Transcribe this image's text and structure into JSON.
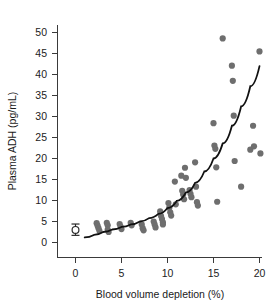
{
  "chart_data": {
    "type": "scatter",
    "title": "",
    "xlabel": "Blood volume depletion (%)",
    "ylabel": "Plasma ADH (pg/mL)",
    "xlim": [
      -1.5,
      21
    ],
    "ylim": [
      -1.5,
      52
    ],
    "xticks": [
      0,
      5,
      10,
      15,
      20
    ],
    "xticklabels": [
      "0",
      "5",
      "10",
      "15",
      "20"
    ],
    "yticks": [
      0,
      5,
      10,
      15,
      20,
      25,
      30,
      35,
      40,
      45,
      50
    ],
    "yticklabels": [
      "0",
      "5",
      "10",
      "15",
      "20",
      "25",
      "30",
      "35",
      "40",
      "45",
      "50"
    ],
    "grid": false,
    "legend": "none",
    "point_color": "#6e6e6e",
    "curve_color": "#111111",
    "series": [
      {
        "name": "Subjects",
        "marker": "filled-circle",
        "points": [
          [
            2.3,
            4.6
          ],
          [
            2.4,
            4.0
          ],
          [
            2.5,
            3.4
          ],
          [
            2.6,
            2.8
          ],
          [
            3.4,
            4.7
          ],
          [
            3.5,
            4.1
          ],
          [
            3.5,
            3.1
          ],
          [
            3.6,
            2.5
          ],
          [
            4.8,
            4.4
          ],
          [
            4.9,
            3.8
          ],
          [
            5.0,
            3.2
          ],
          [
            6.0,
            4.7
          ],
          [
            6.1,
            4.1
          ],
          [
            7.2,
            4.3
          ],
          [
            7.3,
            3.4
          ],
          [
            7.4,
            2.9
          ],
          [
            8.5,
            5.0
          ],
          [
            8.6,
            4.3
          ],
          [
            8.7,
            3.6
          ],
          [
            9.2,
            7.4
          ],
          [
            9.3,
            6.3
          ],
          [
            9.4,
            5.6
          ],
          [
            9.5,
            4.8
          ],
          [
            9.5,
            4.3
          ],
          [
            10.1,
            9.4
          ],
          [
            10.2,
            8.3
          ],
          [
            10.3,
            7.2
          ],
          [
            10.4,
            6.4
          ],
          [
            10.8,
            14.5
          ],
          [
            10.9,
            9.1
          ],
          [
            11.5,
            15.9
          ],
          [
            11.6,
            12.3
          ],
          [
            11.7,
            11.4
          ],
          [
            11.8,
            10.3
          ],
          [
            11.9,
            17.8
          ],
          [
            12.0,
            15.4
          ],
          [
            12.4,
            12.5
          ],
          [
            12.5,
            11.6
          ],
          [
            12.6,
            10.8
          ],
          [
            13.0,
            19.1
          ],
          [
            13.1,
            13.3
          ],
          [
            13.2,
            9.6
          ],
          [
            13.3,
            8.8
          ],
          [
            15.0,
            28.4
          ],
          [
            15.1,
            23.1
          ],
          [
            15.2,
            22.3
          ],
          [
            15.3,
            17.9
          ],
          [
            15.4,
            9.7
          ],
          [
            16.0,
            48.6
          ],
          [
            17.0,
            42.1
          ],
          [
            17.1,
            38.5
          ],
          [
            17.2,
            30.2
          ],
          [
            17.3,
            19.4
          ],
          [
            18.0,
            13.3
          ],
          [
            19.0,
            22.1
          ],
          [
            19.3,
            27.8
          ],
          [
            19.4,
            22.9
          ],
          [
            20.0,
            45.5
          ],
          [
            20.1,
            21.2
          ]
        ]
      },
      {
        "name": "Control (baseline)",
        "marker": "open-circle-errorbar",
        "points": [
          [
            0,
            3.0
          ]
        ],
        "error_low": 1.7,
        "error_high": 4.4
      }
    ],
    "fit_curve": {
      "name": "Fitted exponential trend",
      "description": "Smooth monotonic rising curve through the data",
      "points": [
        [
          1.0,
          1.2
        ],
        [
          2.0,
          1.8
        ],
        [
          3.0,
          2.5
        ],
        [
          4.0,
          3.1
        ],
        [
          5.0,
          3.7
        ],
        [
          6.0,
          4.3
        ],
        [
          7.0,
          5.0
        ],
        [
          8.0,
          5.8
        ],
        [
          9.0,
          6.8
        ],
        [
          10.0,
          8.2
        ],
        [
          11.0,
          9.9
        ],
        [
          12.0,
          11.9
        ],
        [
          13.0,
          14.2
        ],
        [
          14.0,
          16.9
        ],
        [
          15.0,
          20.0
        ],
        [
          16.0,
          23.6
        ],
        [
          17.0,
          27.8
        ],
        [
          18.0,
          32.4
        ],
        [
          19.0,
          37.2
        ],
        [
          20.0,
          42.0
        ]
      ]
    }
  }
}
